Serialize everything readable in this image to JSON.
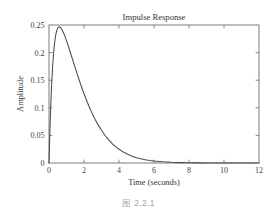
{
  "figure": {
    "caption": "图 2.2.1",
    "background_color": "#ffffff",
    "caption_color": "#a8a8a8"
  },
  "chart_data": {
    "type": "line",
    "title": "Impulse Response",
    "xlabel": "Time (seconds)",
    "ylabel": "Amplitude",
    "xlim": [
      0,
      12
    ],
    "ylim": [
      0,
      0.25
    ],
    "xticks": [
      0,
      2,
      4,
      6,
      8,
      10,
      12
    ],
    "xticklabels": [
      "0",
      "2",
      "4",
      "6",
      "8",
      "10",
      "12"
    ],
    "yticks": [
      0,
      0.05,
      0.1,
      0.15,
      0.2,
      0.25
    ],
    "yticklabels": [
      "0",
      "0.05",
      "0.1",
      "0.15",
      "0.2",
      "0.25"
    ],
    "grid": false,
    "legend": false,
    "box": true,
    "tick_direction": "in",
    "line_color": "#4a4a4a",
    "axis_color": "#6e6e6e",
    "peak": {
      "x": 0.7,
      "y": 0.248
    },
    "series": [
      {
        "name": "impulse response",
        "x": [
          0.0,
          0.05,
          0.1,
          0.15,
          0.2,
          0.25,
          0.3,
          0.35,
          0.4,
          0.45,
          0.5,
          0.55,
          0.6,
          0.65,
          0.7,
          0.75,
          0.8,
          0.85,
          0.9,
          1.0,
          1.1,
          1.2,
          1.3,
          1.4,
          1.5,
          1.6,
          1.7,
          1.8,
          1.9,
          2.0,
          2.2,
          2.4,
          2.6,
          2.8,
          3.0,
          3.2,
          3.4,
          3.6,
          3.8,
          4.0,
          4.25,
          4.5,
          4.75,
          5.0,
          5.25,
          5.5,
          5.75,
          6.0,
          6.5,
          7.0,
          7.5,
          8.0,
          8.5,
          9.0,
          9.5,
          10.0,
          10.5,
          11.0,
          11.5,
          12.0
        ],
        "y": [
          0.0,
          0.0578,
          0.1046,
          0.1421,
          0.1717,
          0.1948,
          0.2123,
          0.2253,
          0.2345,
          0.2407,
          0.2444,
          0.2462,
          0.2465,
          0.2456,
          0.2437,
          0.2411,
          0.2379,
          0.2343,
          0.2303,
          0.2216,
          0.2122,
          0.2024,
          0.1924,
          0.1823,
          0.1722,
          0.1623,
          0.1526,
          0.1432,
          0.1341,
          0.1254,
          0.1091,
          0.0944,
          0.0812,
          0.0695,
          0.0592,
          0.0502,
          0.0424,
          0.0356,
          0.0298,
          0.0249,
          0.0198,
          0.0157,
          0.0124,
          0.0097,
          0.0076,
          0.0059,
          0.0046,
          0.0036,
          0.0021,
          0.0012,
          0.0007,
          0.0004,
          0.0002,
          0.0001,
          0.0001,
          0.0,
          0.0,
          0.0,
          0.0,
          0.0
        ]
      }
    ]
  }
}
